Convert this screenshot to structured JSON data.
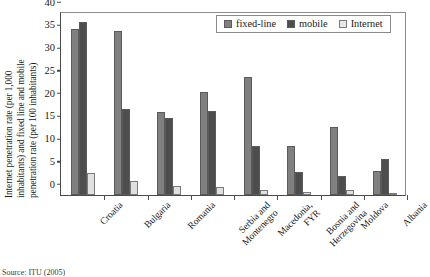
{
  "chart_data": {
    "type": "bar",
    "title": "",
    "xlabel": "",
    "ylabel": "Internet penetration rate (per 1,000 inhabitants) and fixed line and mobile penetration rate (per 100 inhabitants)",
    "ylabel_lines": [
      "Internet penetration rate (per 1,000",
      "inhabitants) and fixed line and mobile",
      "penetration rate (per 100 inhabitants)"
    ],
    "ylim": [
      0,
      40
    ],
    "yticks": [
      0,
      5,
      10,
      15,
      20,
      25,
      30,
      35,
      40
    ],
    "ytick_labels": [
      "0",
      "5",
      "10",
      "15",
      "20",
      "25",
      "30",
      "35",
      "40"
    ],
    "grid": false,
    "legend_position": "top-right",
    "categories": [
      "Croatia",
      "Bulgaria",
      "Romania",
      "Serbia and\nMontenegro",
      "Macedonia,\nFYR",
      "Bosnia and\nHerzegovina",
      "Moldova",
      "Albania"
    ],
    "category_lines": [
      [
        "Croatia"
      ],
      [
        "Bulgaria"
      ],
      [
        "Romania"
      ],
      [
        "Serbia and",
        "Montenegro"
      ],
      [
        "Macedonia,",
        "FYR"
      ],
      [
        "Bosnia and",
        "Herzegovina"
      ],
      [
        "Moldova"
      ],
      [
        "Albania"
      ]
    ],
    "series": [
      {
        "name": "fixed-line",
        "color": "#808080",
        "values": [
          36.5,
          36.0,
          18.2,
          22.7,
          26.0,
          10.7,
          15.0,
          5.3
        ]
      },
      {
        "name": "mobile",
        "color": "#4d4d4d",
        "values": [
          38.0,
          19.0,
          17.0,
          18.5,
          10.7,
          5.0,
          4.2,
          8.0
        ]
      },
      {
        "name": "Internet",
        "color": "#e0e0e0",
        "values": [
          4.8,
          3.0,
          2.0,
          1.7,
          1.0,
          0.6,
          1.2,
          0.1
        ]
      }
    ]
  },
  "legend": {
    "items": [
      {
        "label": "fixed-line",
        "swatch": "legend-swatch-fixed-line"
      },
      {
        "label": "mobile",
        "swatch": "legend-swatch-mobile"
      },
      {
        "label": "Internet",
        "swatch": "legend-swatch-internet"
      }
    ]
  },
  "footer": {
    "source_note": "Source: ITU (2005)"
  }
}
